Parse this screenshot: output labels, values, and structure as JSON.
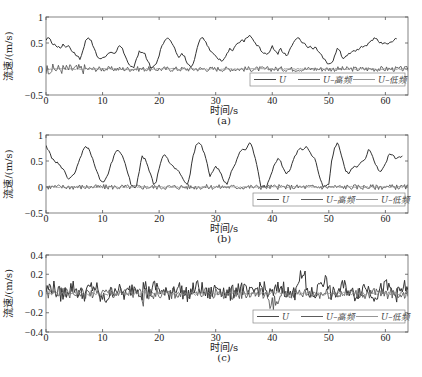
{
  "figure": {
    "panel_labels": [
      "(a)",
      "(b)",
      "(c)"
    ],
    "xlabel": "时间/s",
    "ylabel": "流速/(m/s)"
  },
  "legend": {
    "entries": [
      "U",
      "U–高频",
      "U–低频"
    ]
  },
  "chart_data": [
    {
      "type": "line",
      "panel": "(a)",
      "title": "",
      "xlabel": "时间/s",
      "ylabel": "流速/(m/s)",
      "xlim": [
        0,
        64
      ],
      "ylim": [
        -0.5,
        1
      ],
      "xticks": [
        0,
        10,
        20,
        30,
        40,
        50,
        60
      ],
      "yticks": [
        -0.5,
        0,
        0.5,
        1
      ],
      "ytick_labels": [
        "−0.5",
        "0",
        "0.5",
        "1"
      ],
      "grid": false,
      "legend_position": "lower right",
      "legend": [
        "U",
        "U–高频",
        "U–低频"
      ],
      "series": [
        {
          "name": "U",
          "x": [
            0,
            0.5,
            1,
            1.5,
            2,
            2.5,
            3,
            3.5,
            4,
            4.5,
            5,
            5.5,
            6,
            6.5,
            7,
            7.5,
            8,
            8.5,
            9,
            9.5,
            10,
            11,
            12,
            12.5,
            13,
            13.5,
            14,
            14.5,
            15,
            15.5,
            16,
            16.5,
            17,
            17.5,
            18,
            18.5,
            19,
            19.5,
            20,
            20.5,
            21,
            21.5,
            22,
            22.5,
            23,
            23.5,
            24,
            24.5,
            25,
            25.5,
            26,
            26.5,
            27,
            27.5,
            28,
            28.5,
            29,
            29.5,
            30,
            30.5,
            31,
            31.5,
            32,
            32.5,
            33,
            33.5,
            34,
            34.5,
            35,
            35.5,
            36,
            36.5,
            37,
            37.5,
            38,
            38.5,
            39,
            39.5,
            40,
            40.5,
            41,
            41.5,
            42,
            42.5,
            43,
            43.5,
            44,
            44.5,
            45,
            45.5,
            46,
            46.5,
            47,
            47.5,
            48,
            48.5,
            49,
            49.5,
            50,
            50.5,
            51,
            51.5,
            52,
            52.5,
            53,
            53.5,
            54,
            54.5,
            55,
            55.5,
            56,
            56.5,
            57,
            57.5,
            58,
            58.5,
            59,
            59.5,
            60,
            60.5,
            61,
            61.5,
            62,
            62.5,
            63,
            63.5,
            64
          ],
          "y": [
            0.55,
            0.6,
            0.5,
            0.48,
            0.42,
            0.4,
            0.48,
            0.42,
            0.45,
            0.35,
            0.32,
            0.25,
            0.18,
            0.35,
            0.55,
            0.6,
            0.55,
            0.4,
            0.25,
            0.2,
            0.22,
            0.3,
            0.3,
            0.35,
            0.45,
            0.4,
            0.25,
            0.12,
            0.05,
            0.02,
            0.2,
            0.35,
            0.32,
            0.3,
            0.15,
            0.02,
            0.05,
            0.1,
            0.25,
            0.45,
            0.55,
            0.6,
            0.55,
            0.45,
            0.32,
            0.22,
            0.3,
            0.25,
            0.1,
            0.05,
            0.1,
            0.3,
            0.5,
            0.6,
            0.55,
            0.45,
            0.35,
            0.3,
            0.25,
            0.18,
            0.15,
            0.2,
            0.3,
            0.4,
            0.35,
            0.45,
            0.5,
            0.55,
            0.52,
            0.6,
            0.65,
            0.58,
            0.5,
            0.45,
            0.35,
            0.3,
            0.28,
            0.32,
            0.45,
            0.35,
            0.28,
            0.4,
            0.3,
            0.25,
            0.35,
            0.45,
            0.55,
            0.6,
            0.55,
            0.5,
            0.45,
            0.42,
            0.4,
            0.42,
            0.35,
            0.3,
            0.2,
            0.15,
            0.1,
            0.12,
            0.25,
            0.4,
            0.35,
            0.2,
            0.25,
            0.3,
            0.32,
            0.35,
            0.38,
            0.4,
            0.42,
            0.45,
            0.5,
            0.55,
            0.6,
            0.58,
            0.5,
            0.48,
            0.5,
            0.48,
            0.52,
            0.55,
            0.58
          ]
        },
        {
          "name": "U–高频",
          "x_range": [
            0,
            64
          ],
          "amplitude": 0.05,
          "description": "high-frequency fluctuation about 0"
        },
        {
          "name": "U–低频",
          "x_range": [
            0,
            64
          ],
          "amplitude": 0.02,
          "description": "low-amplitude component near 0"
        }
      ]
    },
    {
      "type": "line",
      "panel": "(b)",
      "title": "",
      "xlabel": "时间/s",
      "ylabel": "流速/(m/s)",
      "xlim": [
        0,
        64
      ],
      "ylim": [
        -0.5,
        1
      ],
      "xticks": [
        0,
        10,
        20,
        30,
        40,
        50,
        60
      ],
      "yticks": [
        -0.5,
        0,
        0.5,
        1
      ],
      "ytick_labels": [
        "−0.5",
        "0",
        "0.5",
        "1"
      ],
      "grid": false,
      "legend_position": "lower right",
      "legend": [
        "U",
        "U–高频",
        "U–低频"
      ],
      "series": [
        {
          "name": "U",
          "x": [
            0,
            0.5,
            1,
            1.5,
            2,
            2.5,
            3,
            3.5,
            4,
            4.5,
            5,
            5.5,
            6,
            6.5,
            7,
            7.5,
            8,
            8.5,
            9,
            9.5,
            10,
            10.5,
            11,
            11.5,
            12,
            12.5,
            13,
            13.5,
            14,
            14.5,
            15,
            15.5,
            16,
            16.5,
            17,
            17.5,
            18,
            18.5,
            19,
            19.5,
            20,
            20.5,
            21,
            21.5,
            22,
            22.5,
            23,
            23.5,
            24,
            24.5,
            25,
            25.5,
            26,
            26.5,
            27,
            27.5,
            28,
            28.5,
            29,
            29.5,
            30,
            30.5,
            31,
            31.5,
            32,
            32.5,
            33,
            33.5,
            34,
            34.5,
            35,
            35.5,
            36,
            36.5,
            37,
            37.5,
            38,
            38.5,
            39,
            39.5,
            40,
            40.5,
            41,
            41.5,
            42,
            42.5,
            43,
            43.5,
            44,
            44.5,
            45,
            45.5,
            46,
            46.5,
            47,
            47.5,
            48,
            48.5,
            49,
            49.5,
            50,
            50.5,
            51,
            51.5,
            52,
            52.5,
            53,
            53.5,
            54,
            54.5,
            55,
            55.5,
            56,
            56.5,
            57,
            57.5,
            58,
            58.5,
            59,
            59.5,
            60,
            60.5,
            61,
            61.5,
            62,
            62.5,
            63,
            63.5,
            64
          ],
          "y": [
            0.8,
            0.7,
            0.55,
            0.5,
            0.48,
            0.42,
            0.35,
            0.25,
            0.15,
            0.2,
            0.25,
            0.4,
            0.55,
            0.7,
            0.78,
            0.75,
            0.6,
            0.45,
            0.3,
            0.15,
            0.1,
            0.15,
            0.25,
            0.45,
            0.6,
            0.7,
            0.68,
            0.6,
            0.45,
            0.25,
            0.05,
            0.0,
            0.02,
            0.3,
            0.6,
            0.55,
            0.4,
            0.25,
            0.05,
            0.1,
            0.35,
            0.55,
            0.62,
            0.55,
            0.45,
            0.4,
            0.35,
            0.3,
            0.2,
            0.1,
            0.05,
            0.25,
            0.6,
            0.8,
            0.85,
            0.8,
            0.65,
            0.45,
            0.2,
            0.3,
            0.4,
            0.35,
            0.25,
            0.1,
            0.05,
            0.2,
            0.35,
            0.45,
            0.6,
            0.7,
            0.72,
            0.75,
            0.85,
            0.75,
            0.55,
            0.3,
            0.0,
            0.02,
            0.0,
            0.15,
            0.3,
            0.45,
            0.55,
            0.5,
            0.35,
            0.25,
            0.3,
            0.45,
            0.6,
            0.7,
            0.75,
            0.72,
            0.78,
            0.7,
            0.6,
            0.55,
            0.35,
            0.15,
            0.0,
            0.02,
            0.05,
            0.5,
            0.75,
            0.85,
            0.7,
            0.5,
            0.3,
            0.25,
            0.35,
            0.4,
            0.38,
            0.45,
            0.5,
            0.55,
            0.72,
            0.65,
            0.5,
            0.4,
            0.3,
            0.35,
            0.45,
            0.6,
            0.62,
            0.6,
            0.55,
            0.58,
            0.6
          ]
        },
        {
          "name": "U–高频",
          "x_range": [
            0,
            64
          ],
          "amplitude": 0.05,
          "description": "high-frequency fluctuation about 0"
        },
        {
          "name": "U–低频",
          "x_range": [
            0,
            64
          ],
          "amplitude": 0.02,
          "description": "low-amplitude component near 0"
        }
      ]
    },
    {
      "type": "line",
      "panel": "(c)",
      "title": "",
      "xlabel": "时间/s",
      "ylabel": "流速/(m/s)",
      "xlim": [
        0,
        64
      ],
      "ylim": [
        -0.4,
        0.4
      ],
      "xticks": [
        0,
        10,
        20,
        30,
        40,
        50,
        60
      ],
      "yticks": [
        -0.4,
        -0.2,
        0,
        0.2,
        0.4
      ],
      "ytick_labels": [
        "−0.4",
        "−0.2",
        "0",
        "0.2",
        "0.4"
      ],
      "grid": false,
      "legend_position": "lower right",
      "legend": [
        "U",
        "U–高频",
        "U–低频"
      ],
      "series": [
        {
          "name": "U",
          "x_range": [
            0,
            64
          ],
          "amplitude": 0.12,
          "description": "fluctuation roughly between -0.15 and 0.2, with peaks near t=17, 45, 49"
        },
        {
          "name": "U–高频",
          "x_range": [
            0,
            64
          ],
          "amplitude": 0.08,
          "description": "high-frequency component, negative spikes near t=17, 39-41"
        },
        {
          "name": "U–低频",
          "x_range": [
            0,
            64
          ],
          "amplitude": 0.03,
          "description": "low-amplitude component near 0"
        }
      ]
    }
  ]
}
